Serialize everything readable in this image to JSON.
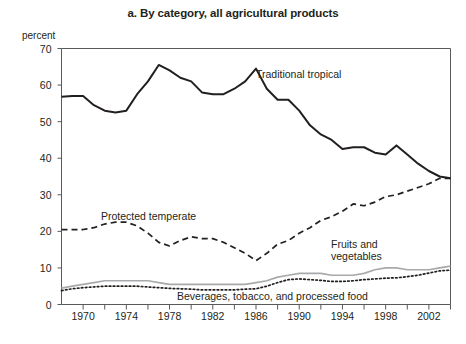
{
  "chart_data": {
    "type": "line",
    "title": "a. By category, all agricultural products",
    "xlabel": "",
    "ylabel": "percent",
    "ylim": [
      0,
      70
    ],
    "xlim": [
      1968,
      2004
    ],
    "ytick_values": [
      0,
      10,
      20,
      30,
      40,
      50,
      60,
      70
    ],
    "xtick_labels": [
      "1970",
      "1974",
      "1978",
      "1982",
      "1986",
      "1990",
      "1994",
      "1998",
      "2002"
    ],
    "xtick_values": [
      1970,
      1974,
      1978,
      1982,
      1986,
      1990,
      1994,
      1998,
      2002
    ],
    "minor_xtick_step": 2,
    "grid": false,
    "legend_position": "inline-annotations",
    "x": [
      1968,
      1969,
      1970,
      1971,
      1972,
      1973,
      1974,
      1975,
      1976,
      1977,
      1978,
      1979,
      1980,
      1981,
      1982,
      1983,
      1984,
      1985,
      1986,
      1987,
      1988,
      1989,
      1990,
      1991,
      1992,
      1993,
      1994,
      1995,
      1996,
      1997,
      1998,
      1999,
      2000,
      2001,
      2002,
      2003,
      2004
    ],
    "series": [
      {
        "name": "Traditional tropical",
        "style": "solid",
        "color": "#231f20",
        "width": 2.0,
        "values": [
          56.8,
          57.0,
          57.0,
          54.5,
          53.0,
          52.5,
          53.0,
          57.5,
          61.0,
          65.5,
          64.0,
          62.0,
          61.0,
          58.0,
          57.5,
          57.5,
          59.0,
          61.0,
          64.5,
          59.0,
          56.0,
          56.0,
          53.0,
          49.0,
          46.5,
          45.0,
          42.5,
          43.0,
          43.0,
          41.5,
          41.0,
          43.5,
          41.0,
          38.5,
          36.5,
          35.0,
          34.5
        ]
      },
      {
        "name": "Protected temperate",
        "style": "dashed",
        "color": "#231f20",
        "width": 1.7,
        "values": [
          20.5,
          20.5,
          20.5,
          21.0,
          22.0,
          22.5,
          22.5,
          21.5,
          19.5,
          17.0,
          16.0,
          17.5,
          18.5,
          18.0,
          18.0,
          17.0,
          15.5,
          14.0,
          12.0,
          14.0,
          16.5,
          17.5,
          19.5,
          21.0,
          23.0,
          24.0,
          25.5,
          27.5,
          27.0,
          28.0,
          29.5,
          30.0,
          31.0,
          32.0,
          33.0,
          34.5,
          34.5
        ]
      },
      {
        "name": "Fruits and vegetables",
        "style": "solid",
        "color": "#a7a9ac",
        "width": 1.7,
        "values": [
          4.5,
          5.0,
          5.5,
          6.0,
          6.5,
          6.5,
          6.5,
          6.5,
          6.5,
          6.0,
          5.5,
          5.5,
          5.5,
          5.5,
          5.5,
          5.5,
          5.5,
          5.5,
          6.0,
          6.5,
          7.5,
          8.0,
          8.5,
          8.5,
          8.5,
          8.0,
          8.0,
          8.0,
          8.5,
          9.5,
          10.0,
          10.0,
          9.5,
          9.5,
          9.5,
          10.0,
          10.5
        ]
      },
      {
        "name": "Beverages, tobacco, and processed food",
        "style": "dotted",
        "color": "#231f20",
        "width": 1.7,
        "values": [
          3.8,
          4.3,
          4.6,
          4.8,
          5.0,
          5.0,
          5.0,
          5.0,
          4.8,
          4.6,
          4.4,
          4.3,
          4.2,
          4.0,
          4.0,
          4.0,
          4.0,
          4.2,
          4.3,
          5.0,
          6.0,
          6.8,
          7.0,
          6.8,
          6.6,
          6.3,
          6.3,
          6.5,
          6.8,
          7.0,
          7.2,
          7.3,
          7.6,
          8.0,
          8.6,
          9.2,
          9.4
        ]
      }
    ],
    "annotations": [
      {
        "text": "Traditional tropical",
        "x_px": 256,
        "y_px": 68,
        "align": "left"
      },
      {
        "text": "Protected temperate",
        "x_px": 101,
        "y_px": 210,
        "align": "left"
      },
      {
        "text": "Fruits and\nvegetables",
        "x_px": 331,
        "y_px": 238,
        "align": "left"
      },
      {
        "text": "Beverages, tobacco, and processed food",
        "x_px": 177,
        "y_px": 290,
        "align": "left"
      }
    ]
  },
  "axis": {
    "unit_label": "percent"
  }
}
